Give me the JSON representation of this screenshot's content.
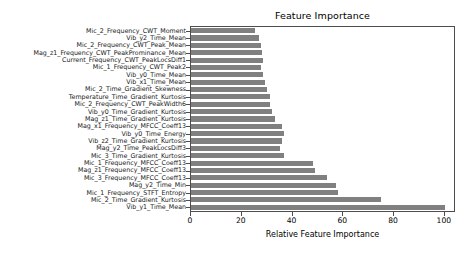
{
  "chart_data": {
    "type": "bar",
    "orientation": "horizontal",
    "title": "Feature Importance",
    "xlabel": "Relative Feature Importance",
    "ylabel": "",
    "xlim": [
      0,
      104
    ],
    "xticks": [
      0,
      20,
      40,
      60,
      80,
      100
    ],
    "xticklabels": [
      "0",
      "20",
      "40",
      "60",
      "80",
      "100"
    ],
    "grid": false,
    "legend": null,
    "bar_color": "#808080",
    "categories": [
      "Mic_2_Frequency_CWT_Moment",
      "Vib_y2_Time_Mean",
      "Mic_2_Frequency_CWT_Peak_Mean",
      "Mag_z1_Frequency_CWT_PeakProminance_Mean",
      "Current_Frequency_CWT_PeakLocsDiff1",
      "Mic_1_Frequency_CWT_Peak2",
      "Vib_y0_Time_Mean",
      "Vib_x1_Time_Mean",
      "Mic_2_Time_Gradient_Skewness",
      "Temperature_Time_Gradient_Kurtosis",
      "Mic_2_Frequency_CWT_PeakWidth6",
      "Vib_y0_Time_Gradient_Kurtosis",
      "Mag_z1_Time_Gradient_Kurtosis",
      "Mag_x1_Frequency_MFCC_Coeff13",
      "Vib_y0_Time_Energy",
      "Vib_z2_Time_Gradient_Kurtosis",
      "Mag_y2_Time_PeakLocsDiff3",
      "Mic_3_Time_Gradient_Kurtosis",
      "Mic_1_Frequency_MFCC_Coeff13",
      "Mag_z1_Frequency_MFCC_Coeff13",
      "Mic_3_Frequency_MFCC_Coeff13",
      "Mag_y2_Time_Min",
      "Mic_1_Frequency_STFT_Entropy",
      "Mic_2_Time_Gradient_Kurtosis",
      "Vib_y1_Time_Mean"
    ],
    "values": [
      25.4,
      26.7,
      27.6,
      28.0,
      28.4,
      27.6,
      28.4,
      29.0,
      30.0,
      31.0,
      31.2,
      32.0,
      33.0,
      36.0,
      36.7,
      36.0,
      35.0,
      36.6,
      48.0,
      49.0,
      53.7,
      57.0,
      58.0,
      75.0,
      100.0
    ]
  }
}
